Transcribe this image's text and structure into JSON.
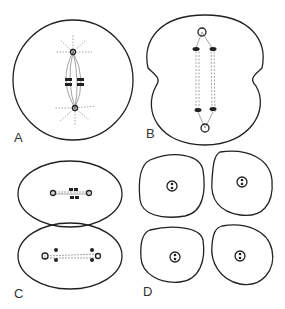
{
  "figure": {
    "panels": [
      {
        "id": "A",
        "label": "A",
        "description": "metaphase: round cell with spindle and chromosomes aligned at equator"
      },
      {
        "id": "B",
        "label": "B",
        "description": "anaphase/telophase: elongated cell with cleavage furrows; chromosomes at poles"
      },
      {
        "id": "C",
        "label": "C",
        "description": "two daughter cells in second division"
      },
      {
        "id": "D",
        "label": "D",
        "description": "four resulting cells each with a nucleus"
      }
    ],
    "colors": {
      "line": "#222222",
      "background": "#ffffff"
    }
  }
}
